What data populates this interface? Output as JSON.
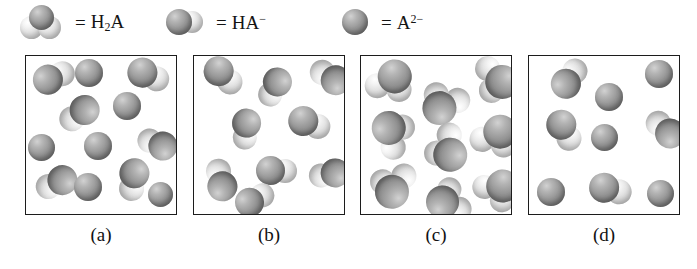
{
  "figure": {
    "background_color": "#ffffff",
    "border_color": "#1c1c1c"
  },
  "legend": {
    "equals_sign": "=",
    "items": [
      {
        "id": "h2a",
        "icon": "h2a-molecule-icon",
        "label_html": "H2A",
        "label_base": "H",
        "label_sub": "2",
        "label_tail": "A",
        "sphere_count": 3,
        "description": "one dark central sphere with two light spheres"
      },
      {
        "id": "ha-minus",
        "icon": "ha-minus-molecule-icon",
        "label_base": "HA",
        "label_sup": "−",
        "sphere_count": 2,
        "description": "one dark sphere with one light sphere"
      },
      {
        "id": "a-2minus",
        "icon": "a-2minus-ion-icon",
        "label_base": "A",
        "label_sup": "2−",
        "sphere_count": 1,
        "description": "single dark sphere"
      }
    ]
  },
  "chart_data": {
    "type": "diagram",
    "xlabel": "",
    "ylabel": "",
    "categories": [
      "(a)",
      "(b)",
      "(c)",
      "(d)"
    ],
    "species_legend": [
      "H2A",
      "HA−",
      "A2−"
    ],
    "series": [
      {
        "name": "H2A",
        "values": [
          0,
          0,
          9,
          0
        ]
      },
      {
        "name": "HA-",
        "values": [
          6,
          9,
          0,
          4
        ]
      },
      {
        "name": "A2-",
        "values": [
          6,
          0,
          0,
          5
        ]
      }
    ],
    "panels": [
      {
        "label": "(a)",
        "total_particles": 12,
        "counts": {
          "H2A": 0,
          "HA-": 6,
          "A2-": 6
        },
        "description": "Mixture of HA- and A2- particles"
      },
      {
        "label": "(b)",
        "total_particles": 9,
        "counts": {
          "H2A": 0,
          "HA-": 9,
          "A2-": 0
        },
        "description": "All particles are HA- two-sphere units"
      },
      {
        "label": "(c)",
        "total_particles": 9,
        "counts": {
          "H2A": 9,
          "HA-": 0,
          "A2-": 0
        },
        "description": "All particles are H2A three-sphere molecules"
      },
      {
        "label": "(d)",
        "total_particles": 9,
        "counts": {
          "H2A": 0,
          "HA-": 4,
          "A2-": 5
        },
        "description": "Mixture of HA- and A2- particles, fewer total"
      }
    ]
  },
  "panels": [
    {
      "label": "(a)",
      "particles": [
        {
          "type": "HA-",
          "x": 6,
          "y": 5,
          "size": 30,
          "rot": -28
        },
        {
          "type": "A2-",
          "x": 49,
          "y": 3,
          "size": 28,
          "rot": 0
        },
        {
          "type": "HA-",
          "x": 101,
          "y": 4,
          "size": 30,
          "rot": 18
        },
        {
          "type": "HA-",
          "x": 30,
          "y": 44,
          "size": 30,
          "rot": 140
        },
        {
          "type": "A2-",
          "x": 87,
          "y": 36,
          "size": 28,
          "rot": 0
        },
        {
          "type": "A2-",
          "x": 2,
          "y": 78,
          "size": 27,
          "rot": 0
        },
        {
          "type": "A2-",
          "x": 58,
          "y": 76,
          "size": 28,
          "rot": 0
        },
        {
          "type": "HA-",
          "x": 108,
          "y": 73,
          "size": 29,
          "rot": 200
        },
        {
          "type": "HA-",
          "x": 7,
          "y": 113,
          "size": 30,
          "rot": 150
        },
        {
          "type": "A2-",
          "x": 48,
          "y": 117,
          "size": 28,
          "rot": 0
        },
        {
          "type": "HA-",
          "x": 85,
          "y": 110,
          "size": 30,
          "rot": 95
        },
        {
          "type": "A2-",
          "x": 122,
          "y": 126,
          "size": 25,
          "rot": 0
        }
      ]
    },
    {
      "label": "(b)",
      "particles": [
        {
          "type": "HA-",
          "x": 8,
          "y": 5,
          "size": 30,
          "rot": 38
        },
        {
          "type": "HA-",
          "x": 58,
          "y": 18,
          "size": 29,
          "rot": 118
        },
        {
          "type": "HA-",
          "x": 112,
          "y": 6,
          "size": 30,
          "rot": 205
        },
        {
          "type": "HA-",
          "x": 30,
          "y": 60,
          "size": 29,
          "rot": 95
        },
        {
          "type": "HA-",
          "x": 94,
          "y": 52,
          "size": 30,
          "rot": 15
        },
        {
          "type": "HA-",
          "x": 3,
          "y": 108,
          "size": 30,
          "rot": 250
        },
        {
          "type": "HA-",
          "x": 62,
          "y": 100,
          "size": 29,
          "rot": 0
        },
        {
          "type": "HA-",
          "x": 112,
          "y": 104,
          "size": 29,
          "rot": 168
        },
        {
          "type": "HA-",
          "x": 40,
          "y": 128,
          "size": 29,
          "rot": 330
        }
      ]
    },
    {
      "label": "(c)",
      "particles": [
        {
          "type": "H2A",
          "x": 5,
          "y": 3,
          "size": 34,
          "rot": 15
        },
        {
          "type": "H2A",
          "x": 55,
          "y": 22,
          "size": 34,
          "rot": 200
        },
        {
          "type": "H2A",
          "x": 108,
          "y": 2,
          "size": 34,
          "rot": 85
        },
        {
          "type": "H2A",
          "x": 7,
          "y": 52,
          "size": 34,
          "rot": 300
        },
        {
          "type": "H2A",
          "x": 58,
          "y": 70,
          "size": 34,
          "rot": 130
        },
        {
          "type": "H2A",
          "x": 110,
          "y": 58,
          "size": 34,
          "rot": 20
        },
        {
          "type": "H2A",
          "x": 4,
          "y": 105,
          "size": 34,
          "rot": 170
        },
        {
          "type": "H2A",
          "x": 62,
          "y": 120,
          "size": 33,
          "rot": 245
        },
        {
          "type": "H2A",
          "x": 112,
          "y": 112,
          "size": 33,
          "rot": 40
        }
      ]
    },
    {
      "label": "(d)",
      "particles": [
        {
          "type": "HA-",
          "x": 18,
          "y": 6,
          "size": 30,
          "rot": 300
        },
        {
          "type": "A2-",
          "x": 66,
          "y": 27,
          "size": 28,
          "rot": 0
        },
        {
          "type": "A2-",
          "x": 116,
          "y": 4,
          "size": 28,
          "rot": 0
        },
        {
          "type": "HA-",
          "x": 14,
          "y": 60,
          "size": 30,
          "rot": 55
        },
        {
          "type": "A2-",
          "x": 62,
          "y": 68,
          "size": 27,
          "rot": 0
        },
        {
          "type": "HA-",
          "x": 112,
          "y": 58,
          "size": 30,
          "rot": 215
        },
        {
          "type": "A2-",
          "x": 8,
          "y": 122,
          "size": 28,
          "rot": 0
        },
        {
          "type": "HA-",
          "x": 60,
          "y": 118,
          "size": 30,
          "rot": 10
        },
        {
          "type": "A2-",
          "x": 118,
          "y": 124,
          "size": 27,
          "rot": 0
        }
      ]
    }
  ],
  "layout": {
    "box_positions": [
      25,
      193,
      360,
      528
    ],
    "box_top": 55,
    "box_width": 152,
    "box_height": 160,
    "label_top": 224
  }
}
